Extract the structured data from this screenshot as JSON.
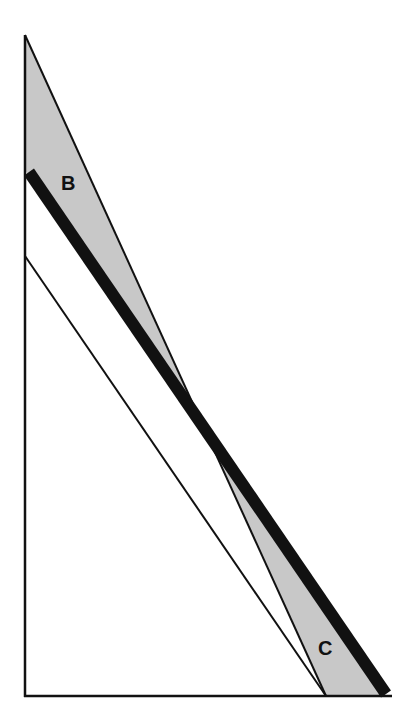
{
  "diagram": {
    "type": "geometric-area-diagram",
    "colors": {
      "background": "#ffffff",
      "line": "#111111",
      "shade": "#c8c8c8"
    },
    "labels": {
      "region_b": "B",
      "region_c": "C"
    },
    "points": {
      "origin": [
        25,
        696
      ],
      "apex": [
        25,
        35
      ],
      "thick_start": [
        25,
        170
      ],
      "thin_start": [
        25,
        256
      ],
      "steep_end": [
        326,
        696
      ],
      "thick_end": [
        388,
        696
      ],
      "thin_end": [
        326,
        696
      ],
      "crossing": [
        206,
        432
      ],
      "axis_end": [
        392,
        696
      ]
    }
  }
}
